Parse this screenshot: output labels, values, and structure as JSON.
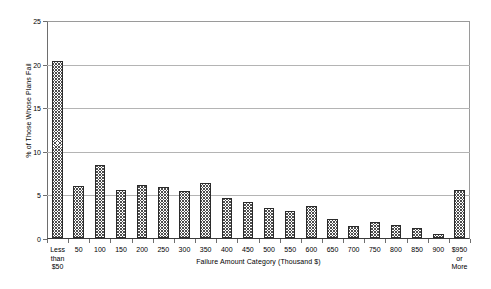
{
  "chart_data": {
    "type": "bar",
    "title": "",
    "xlabel": "Failure Amount Category (Thousand $)",
    "ylabel": "% of Those Whose Plans Fail",
    "ylim": [
      0,
      25
    ],
    "yticks": [
      0,
      5,
      10,
      15,
      20,
      25
    ],
    "ytick_labels": [
      "0",
      "5",
      "10",
      "15",
      "20",
      "25"
    ],
    "grid": true,
    "legend": "none",
    "categories": [
      "Less\nthan\n$50",
      "50",
      "100",
      "150",
      "200",
      "250",
      "300",
      "350",
      "400",
      "450",
      "500",
      "550",
      "600",
      "650",
      "700",
      "750",
      "800",
      "850",
      "900",
      "$950\nor\nMore"
    ],
    "values": [
      20.3,
      6.0,
      8.4,
      5.5,
      6.1,
      5.8,
      5.4,
      6.3,
      4.6,
      4.1,
      3.4,
      3.1,
      3.7,
      2.2,
      1.4,
      1.8,
      1.5,
      1.2,
      0.5,
      5.5
    ],
    "bar_fill": "diagonal-crosshatch",
    "bar_edge_color": "#2b2b2b",
    "bar_fill_color": "#4d4d4d"
  }
}
